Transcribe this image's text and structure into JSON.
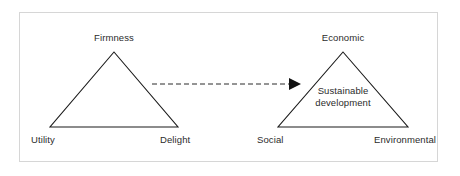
{
  "figure": {
    "title": "",
    "background_color": "#ffffff",
    "frame_color": "#d6d6d6",
    "line_color": "#1a1a1a",
    "text_color": "#2b2b2b"
  },
  "left_triangle": {
    "name": "vitruvian-triangle",
    "apex_label": "Firmness",
    "bottom_left_label": "Utility",
    "bottom_right_label": "Delight"
  },
  "right_triangle": {
    "name": "sustainability-triangle",
    "apex_label": "Economic",
    "bottom_left_label": "Social",
    "bottom_right_label": "Environmental",
    "inner_label_line1": "Sustainable",
    "inner_label_line2": "development"
  },
  "connector": {
    "name": "dashed-arrow",
    "style": "dashed",
    "direction": "left-to-right",
    "label": ""
  }
}
